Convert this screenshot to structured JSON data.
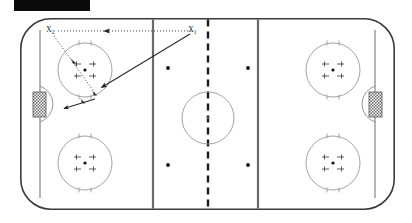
{
  "page": {
    "background_color": "#ffffff",
    "width": 412,
    "height": 223
  },
  "redaction": {
    "name": "black-redaction-bar",
    "color": "#0a0a0a",
    "x": 14,
    "y": 0,
    "width": 76,
    "height": 11
  },
  "rink": {
    "surface_color": "#ffffff",
    "board_color": "#3a3a3a",
    "board_width": 1.6,
    "x": 20,
    "y": 18,
    "width": 375,
    "height": 192,
    "corner_radius": 30,
    "goal_line_color": "#4a4a4a",
    "blue_line_color": "#5a5a5a",
    "center_line_color": "#1a1a1a",
    "circle_color": "#8a8a8a",
    "dot_color": "#1a1a1a",
    "goal_net_color": "#555555"
  },
  "markings": {
    "goal_lines": [
      {
        "name": "goal-line-left",
        "x": 40
      },
      {
        "name": "goal-line-right",
        "x": 375
      }
    ],
    "blue_lines": [
      {
        "name": "blue-line-left",
        "x": 153
      },
      {
        "name": "blue-line-right",
        "x": 258
      }
    ],
    "center_line": {
      "name": "center-red-line",
      "x": 208,
      "dashed": true
    },
    "center_circle": {
      "name": "center-faceoff-circle",
      "cx": 208,
      "cy": 118,
      "r": 26
    },
    "center_dot": {
      "name": "center-faceoff-dot",
      "cx": 208,
      "cy": 118,
      "r": 1.3
    },
    "faceoff_circles": [
      {
        "name": "faceoff-circle-top-left",
        "cx": 85,
        "cy": 70,
        "r": 27
      },
      {
        "name": "faceoff-circle-bottom-left",
        "cx": 85,
        "cy": 163,
        "r": 27
      },
      {
        "name": "faceoff-circle-top-right",
        "cx": 333,
        "cy": 70,
        "r": 27
      },
      {
        "name": "faceoff-circle-bottom-right",
        "cx": 333,
        "cy": 163,
        "r": 27
      }
    ],
    "neutral_dots": [
      {
        "name": "neutral-dot-top-left",
        "cx": 168,
        "cy": 68,
        "r": 1.8
      },
      {
        "name": "neutral-dot-top-right",
        "cx": 248,
        "cy": 68,
        "r": 1.8
      },
      {
        "name": "neutral-dot-bottom-left",
        "cx": 168,
        "cy": 165,
        "r": 1.8
      },
      {
        "name": "neutral-dot-bottom-right",
        "cx": 248,
        "cy": 165,
        "r": 1.8
      }
    ],
    "goals": [
      {
        "name": "goal-net-left",
        "x": 33,
        "y": 92,
        "width": 13,
        "height": 25,
        "crease_side": "right"
      },
      {
        "name": "goal-net-right",
        "x": 369,
        "y": 92,
        "width": 13,
        "height": 25,
        "crease_side": "left"
      }
    ],
    "creases": [
      {
        "name": "goal-crease-left",
        "cx": 46,
        "cy": 104,
        "r": 19
      },
      {
        "name": "goal-crease-right",
        "cx": 369,
        "cy": 104,
        "r": 19
      }
    ]
  },
  "annotations": {
    "players": [
      {
        "name": "player-label-x2",
        "text": "X",
        "sub": "2",
        "x": 47,
        "y": 26
      },
      {
        "name": "player-label-x1",
        "text": "X",
        "sub": "1",
        "x": 188,
        "y": 26
      }
    ],
    "paths": [
      {
        "name": "pass-line-x1-to-x2",
        "style": "dotted",
        "description": "Puck pass from X1 back to X2 along the top of the zone",
        "points": [
          [
            192,
            31
          ],
          [
            56,
            31
          ]
        ],
        "arrow_at": [
          108,
          31
        ],
        "arrow_direction": "left",
        "color": "#2a2a2a"
      },
      {
        "name": "skate-route-x1-to-slot",
        "style": "solid",
        "description": "X1 skates diagonally from neutral zone into the low slot",
        "points": [
          [
            190,
            34
          ],
          [
            99,
            89
          ]
        ],
        "arrow_at": [
          101,
          88
        ],
        "arrow_direction": "down-left",
        "color": "#2a2a2a"
      },
      {
        "name": "skate-route-x2-to-net",
        "style": "dotted",
        "description": "X2 drives diagonally down through the faceoff circle toward the net",
        "points": [
          [
            54,
            36
          ],
          [
            97,
            95
          ]
        ],
        "arrow_at": [
          73,
          62
        ],
        "arrow_direction": "down-right",
        "color": "#2a2a2a"
      },
      {
        "name": "drive-to-crease-arrow",
        "style": "solid",
        "description": "Final drive to the crease in front of the left goal",
        "points": [
          [
            97,
            95
          ],
          [
            62,
            110
          ]
        ],
        "arrow_at": [
          63,
          109
        ],
        "arrow_direction": "down-left",
        "color": "#2a2a2a"
      }
    ]
  },
  "legend": {
    "notes": []
  }
}
